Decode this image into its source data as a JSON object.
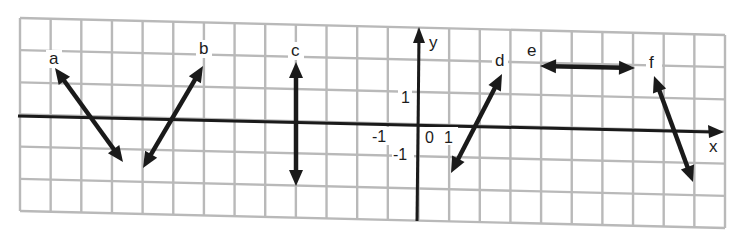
{
  "figure": {
    "axes": {
      "x_label": "x",
      "y_label": "y",
      "origin_label": "0",
      "x_tick_neg": "-1",
      "x_tick_pos": "1",
      "y_tick_pos": "1",
      "y_tick_neg": "-1"
    },
    "lines": [
      {
        "id": "a",
        "label": "a",
        "slope_type": "negative",
        "x1": 55,
        "y1": 68,
        "x2": 123,
        "y2": 162
      },
      {
        "id": "b",
        "label": "b",
        "slope_type": "positive",
        "x1": 203,
        "y1": 66,
        "x2": 143,
        "y2": 168
      },
      {
        "id": "c",
        "label": "c",
        "slope_type": "undefined (vertical)",
        "x1": 296,
        "y1": 62,
        "x2": 296,
        "y2": 186
      },
      {
        "id": "d",
        "label": "d",
        "slope_type": "positive",
        "x1": 502,
        "y1": 74,
        "x2": 451,
        "y2": 173
      },
      {
        "id": "e",
        "label": "e",
        "slope_type": "zero (horizontal)",
        "x1": 540,
        "y1": 66,
        "x2": 635,
        "y2": 68
      },
      {
        "id": "f",
        "label": "f",
        "slope_type": "negative",
        "x1": 654,
        "y1": 76,
        "x2": 693,
        "y2": 182
      }
    ],
    "colors": {
      "grid": "#b9b9b9",
      "ink": "#1a1a1a",
      "background": "#ffffff"
    }
  }
}
